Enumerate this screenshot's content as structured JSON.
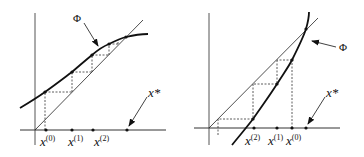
{
  "left_panel": {
    "curve_label": "Φ",
    "fixed_point_label": "x*",
    "iterates": [
      {
        "base": "x",
        "sup": "(0)"
      },
      {
        "base": "x",
        "sup": "(1)"
      },
      {
        "base": "x",
        "sup": "(2)"
      }
    ]
  },
  "right_panel": {
    "curve_label": "Φ",
    "fixed_point_label": "x*",
    "iterates": [
      {
        "base": "x",
        "sup": "(2)"
      },
      {
        "base": "x",
        "sup": "(1)"
      },
      {
        "base": "x",
        "sup": "(0)"
      }
    ]
  }
}
